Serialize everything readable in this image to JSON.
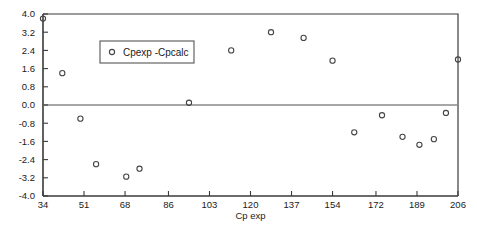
{
  "chart_data": {
    "type": "scatter",
    "title": "",
    "xlabel": "Cp exp",
    "ylabel": "",
    "xlim": [
      34,
      206
    ],
    "ylim": [
      -4.0,
      4.0
    ],
    "grid": false,
    "legend_position": "upper-left-inside",
    "xticks": [
      34,
      51,
      68,
      86,
      103,
      120,
      137,
      154,
      172,
      189,
      206
    ],
    "xtick_labels": [
      "34",
      "51",
      "68",
      "86",
      "103",
      "120",
      "137",
      "154",
      "172",
      "189",
      "206"
    ],
    "yticks": [
      4.0,
      3.2,
      2.4,
      1.6,
      0.8,
      0.0,
      -0.8,
      -1.6,
      -2.4,
      -3.2,
      -4.0
    ],
    "ytick_labels": [
      "4.0",
      "3.2",
      "2.4",
      "1.6",
      "0.8",
      "0.0",
      "-0.8",
      "-1.6",
      "-2.4",
      "-3.2",
      "-4.0"
    ],
    "zero_reference_line": 0.0,
    "series": [
      {
        "name": "Cpexp -Cpcalc",
        "marker": "open-circle",
        "color": "#444444",
        "points": [
          {
            "x": 34.0,
            "y": 3.8
          },
          {
            "x": 42.0,
            "y": 1.4
          },
          {
            "x": 49.5,
            "y": -0.6
          },
          {
            "x": 56.0,
            "y": -2.6
          },
          {
            "x": 68.5,
            "y": -3.15
          },
          {
            "x": 74.0,
            "y": -2.8
          },
          {
            "x": 94.5,
            "y": 0.1
          },
          {
            "x": 112.0,
            "y": 2.4
          },
          {
            "x": 128.5,
            "y": 3.2
          },
          {
            "x": 142.0,
            "y": 2.95
          },
          {
            "x": 154.0,
            "y": 1.95
          },
          {
            "x": 163.0,
            "y": -1.2
          },
          {
            "x": 174.5,
            "y": -0.45
          },
          {
            "x": 183.0,
            "y": -1.4
          },
          {
            "x": 190.0,
            "y": -1.75
          },
          {
            "x": 196.0,
            "y": -1.5
          },
          {
            "x": 201.0,
            "y": -0.35
          },
          {
            "x": 206.0,
            "y": 2.0
          }
        ]
      }
    ]
  },
  "legend": {
    "entries": [
      {
        "label": "Cpexp -Cpcalc",
        "marker": "open-circle"
      }
    ]
  },
  "axes": {
    "x_axis_title": "Cp exp"
  }
}
